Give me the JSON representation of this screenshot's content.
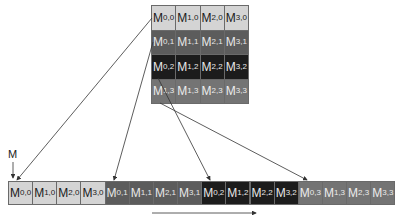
{
  "diagram": {
    "matrix_label": "M",
    "grid": {
      "rows": [
        [
          "M",
          "M",
          "M",
          "M"
        ],
        [
          "M",
          "M",
          "M",
          "M"
        ],
        [
          "M",
          "M",
          "M",
          "M"
        ],
        [
          "M",
          "M",
          "M",
          "M"
        ]
      ],
      "subscripts": [
        [
          "0,0",
          "1,0",
          "2,0",
          "3,0"
        ],
        [
          "0,1",
          "1,1",
          "2,1",
          "3,1"
        ],
        [
          "0,2",
          "1,2",
          "2,2",
          "3,2"
        ],
        [
          "1,3",
          "1,3",
          "2,3",
          "3,3"
        ]
      ]
    },
    "linear": {
      "subscripts": [
        "0,0",
        "1,0",
        "2,0",
        "3,0",
        "0,1",
        "1,1",
        "2,1",
        "3,1",
        "0,2",
        "1,2",
        "2,2",
        "3,2",
        "0,3",
        "1,3",
        "2,3",
        "3,3"
      ]
    },
    "colors": {
      "row0": "#d4d4d4",
      "row1": "#5c5c5c",
      "row2": "#1c1c1c",
      "row3": "#747474",
      "arrow": "#333333"
    }
  }
}
